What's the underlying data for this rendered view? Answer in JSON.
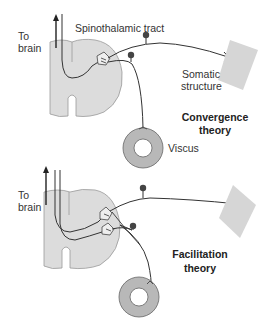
{
  "figure": {
    "panels": [
      {
        "id": "convergence",
        "title_line1": "Convergence",
        "title_line2": "theory",
        "labels": {
          "to_brain_1": "To",
          "to_brain_2": "brain",
          "tract": "Spinothalamic tract",
          "somatic_1": "Somatic",
          "somatic_2": "structure",
          "viscus": "Viscus"
        }
      },
      {
        "id": "facilitation",
        "title_line1": "Facilitation",
        "title_line2": "theory",
        "labels": {
          "to_brain_1": "To",
          "to_brain_2": "brain"
        }
      }
    ],
    "colors": {
      "cord_fill": "#dcdcdc",
      "cord_stroke": "#999999",
      "somatic_fill": "#d6d6d6",
      "viscus_fill": "#b8b8b8",
      "line": "#333333",
      "ganglion": "#444444"
    }
  }
}
